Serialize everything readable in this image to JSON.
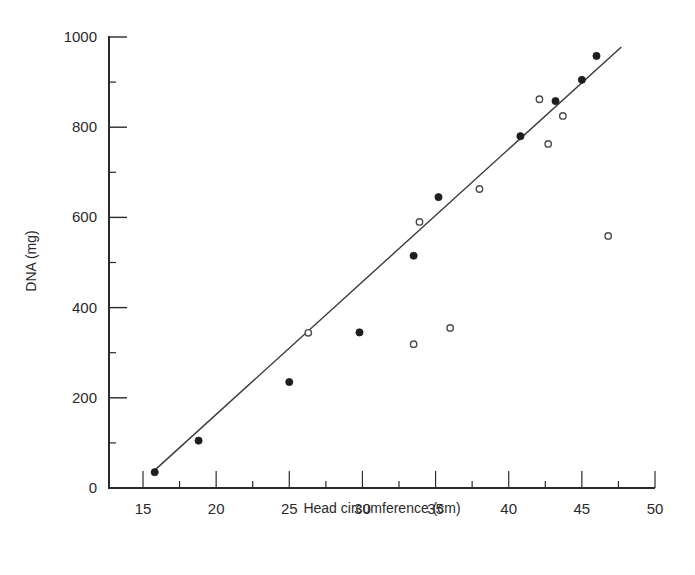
{
  "chart_data": {
    "type": "scatter",
    "title": "",
    "xlabel": "Head circumference (cm)",
    "ylabel": "DNA (mg)",
    "xlim": [
      12.5,
      50
    ],
    "ylim": [
      0,
      1000
    ],
    "x_ticks": [
      15,
      20,
      25,
      30,
      35,
      40,
      45,
      50
    ],
    "x_minor_ticks": [
      17.5,
      22.5,
      27.5,
      32.5,
      37.5,
      42.5,
      47.5
    ],
    "y_ticks": [
      0,
      200,
      400,
      600,
      800,
      1000
    ],
    "y_minor_ticks": [
      100,
      300,
      500,
      700,
      900
    ],
    "grid": false,
    "legend": null,
    "series": [
      {
        "name": "filled",
        "marker": "filled-circle",
        "points": [
          [
            15.8,
            35
          ],
          [
            18.8,
            105
          ],
          [
            25.0,
            235
          ],
          [
            29.8,
            345
          ],
          [
            33.5,
            515
          ],
          [
            35.2,
            645
          ],
          [
            40.8,
            780
          ],
          [
            43.2,
            858
          ],
          [
            45.0,
            905
          ],
          [
            46.0,
            958
          ]
        ]
      },
      {
        "name": "open",
        "marker": "open-circle",
        "points": [
          [
            26.3,
            344
          ],
          [
            33.5,
            319
          ],
          [
            33.9,
            590
          ],
          [
            36.0,
            355
          ],
          [
            38.0,
            663
          ],
          [
            42.1,
            862
          ],
          [
            42.7,
            763
          ],
          [
            43.7,
            825
          ],
          [
            46.8,
            559
          ]
        ]
      },
      {
        "name": "regression-line",
        "type": "line",
        "points": [
          [
            15.75,
            38
          ],
          [
            47.7,
            978
          ]
        ]
      }
    ]
  },
  "colors": {
    "ink": "#2a2a2a",
    "background": "#ffffff"
  }
}
